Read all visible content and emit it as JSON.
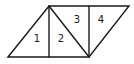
{
  "diagram": {
    "labels": [
      {
        "id": "1",
        "text": "1",
        "x": 37,
        "y": 38
      },
      {
        "id": "2",
        "text": "2",
        "x": 61,
        "y": 38
      },
      {
        "id": "3",
        "text": "3",
        "x": 77,
        "y": 19
      },
      {
        "id": "4",
        "text": "4",
        "x": 101,
        "y": 19
      }
    ],
    "stroke_color": "#1a1a1a",
    "background": "#ffffff"
  }
}
